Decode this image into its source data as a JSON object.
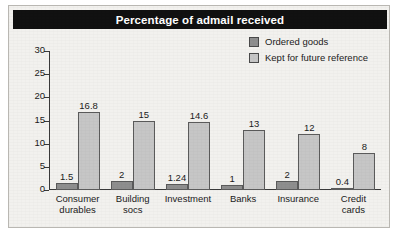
{
  "chart_data": {
    "type": "bar",
    "title": "Percentage of admail received",
    "xlabel": "",
    "ylabel": "",
    "ylim": [
      0,
      30
    ],
    "yticks": [
      "0",
      "5",
      "10",
      "15",
      "20",
      "25",
      "30"
    ],
    "grid": false,
    "legend_position": "top-right",
    "categories": [
      "Consumer durables",
      "Building socs",
      "Investment",
      "Banks",
      "Insurance",
      "Credit cards"
    ],
    "category_lines": [
      [
        "Consumer",
        "durables"
      ],
      [
        "Building",
        "socs"
      ],
      [
        "Investment",
        ""
      ],
      [
        "Banks",
        ""
      ],
      [
        "Insurance",
        ""
      ],
      [
        "Credit",
        "cards"
      ]
    ],
    "series": [
      {
        "name": "Ordered goods",
        "color": "#8e8e8e",
        "values": [
          1.5,
          2,
          1.24,
          1,
          2,
          0.4
        ],
        "labels": [
          "1.5",
          "2",
          "1.24",
          "1",
          "2",
          "0.4"
        ]
      },
      {
        "name": "Kept for future reference",
        "color": "#c6c6c6",
        "values": [
          16.8,
          15,
          14.6,
          13,
          12,
          8
        ],
        "labels": [
          "16.8",
          "15",
          "14.6",
          "13",
          "12",
          "8"
        ]
      }
    ]
  },
  "legend": {
    "items": [
      {
        "label": "Ordered goods",
        "color": "#8e8e8e"
      },
      {
        "label": "Kept for future reference",
        "color": "#c6c6c6"
      }
    ]
  },
  "colors": {
    "title_banner_bg": "#111111",
    "title_text": "#ffffff",
    "figure_bg": "#f2f1ee",
    "axis": "#3a3a3a",
    "bar_border": "#5b5b5b"
  }
}
